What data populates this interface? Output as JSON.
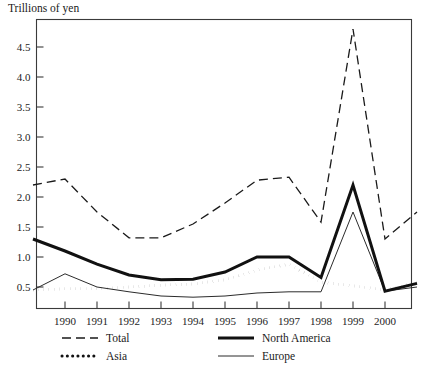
{
  "chart_data": {
    "type": "line",
    "title": "Trillions of yen",
    "xlabel": "",
    "ylabel": "Trillions of yen",
    "ylim": [
      0,
      4.9
    ],
    "xlim": [
      1989,
      2001
    ],
    "grid": false,
    "legend_position": "bottom",
    "ytick_labels": [
      "0.5",
      "1.0",
      "1.5",
      "2.0",
      "2.5",
      "3.0",
      "3.5",
      "4.0",
      "4.5"
    ],
    "ytick_values": [
      0.5,
      1.0,
      1.5,
      2.0,
      2.5,
      3.0,
      3.5,
      4.0,
      4.5
    ],
    "xtick_labels": [
      "1990",
      "1991",
      "1992",
      "1993",
      "1994",
      "1995",
      "1996",
      "1997",
      "1998",
      "1999",
      "2000"
    ],
    "xtick_values": [
      1990,
      1991,
      1992,
      1993,
      1994,
      1995,
      1996,
      1997,
      1998,
      1999,
      2000
    ],
    "x": [
      1989,
      1990,
      1991,
      1992,
      1993,
      1994,
      1995,
      1996,
      1997,
      1998,
      1999,
      2000,
      2001
    ],
    "series": [
      {
        "name": "Total",
        "style": "dashed",
        "color": "#1a1a1a",
        "width": 1.3,
        "values": [
          2.2,
          2.3,
          1.75,
          1.32,
          1.32,
          1.55,
          1.9,
          2.28,
          2.33,
          1.58,
          4.8,
          1.3,
          1.75
        ]
      },
      {
        "name": "North America",
        "style": "solid-thick",
        "color": "#111111",
        "width": 3.0,
        "values": [
          1.3,
          1.1,
          0.88,
          0.7,
          0.62,
          0.63,
          0.75,
          1.0,
          1.0,
          0.66,
          2.2,
          0.43,
          0.56
        ]
      },
      {
        "name": "Asia",
        "style": "dotted",
        "color": "#111111",
        "width": 3.0,
        "values": [
          0.45,
          0.47,
          0.47,
          0.5,
          0.53,
          0.55,
          0.62,
          0.78,
          0.88,
          0.58,
          0.52,
          0.45,
          0.58
        ]
      },
      {
        "name": "Europe",
        "style": "solid-thin",
        "color": "#2b2b2b",
        "width": 1.0,
        "values": [
          0.45,
          0.72,
          0.5,
          0.42,
          0.35,
          0.33,
          0.35,
          0.4,
          0.42,
          0.42,
          1.75,
          0.43,
          0.5
        ]
      }
    ]
  },
  "legend": {
    "items": [
      {
        "label": "Total",
        "key": "total"
      },
      {
        "label": "North America",
        "key": "north-america"
      },
      {
        "label": "Asia",
        "key": "asia"
      },
      {
        "label": "Europe",
        "key": "europe"
      }
    ]
  }
}
